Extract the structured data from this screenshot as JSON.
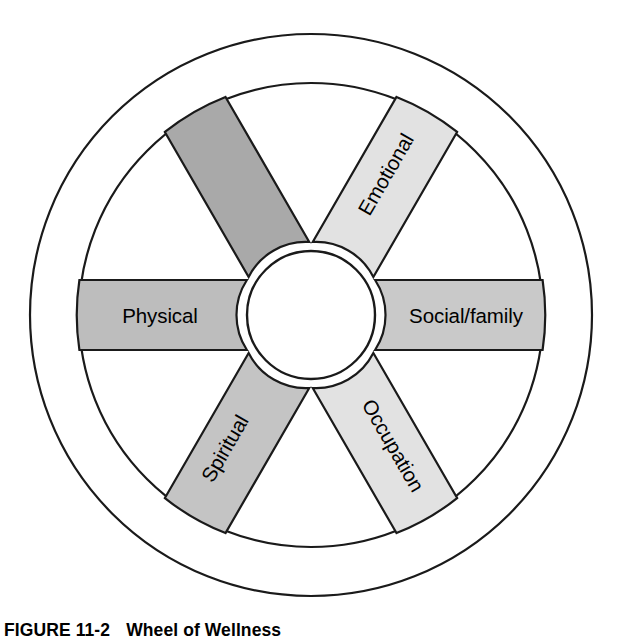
{
  "figure": {
    "caption_number": "FIGURE 11-2",
    "caption_title": "Wheel of Wellness",
    "title_alt": "Wheel of Wellness"
  },
  "wheel": {
    "center_x": 311,
    "center_y": 315,
    "outer_radius": 281,
    "inner_radius": 232,
    "hub_radius": 64,
    "spoke_half_width": 35,
    "stroke_color": "#1a1a1a",
    "background_color": "#ffffff",
    "hub_label": ""
  },
  "spokes": [
    {
      "id": "physical",
      "label": "Physical",
      "angle_deg": 180,
      "text_rotation_deg": 0,
      "fill": "#bdbdbd"
    },
    {
      "id": "mental",
      "label": "Mental",
      "angle_deg": 240,
      "text_rotation_deg": 60,
      "fill": "#e2e2e2"
    },
    {
      "id": "emotional",
      "label": "Emotional",
      "angle_deg": 300,
      "text_rotation_deg": -60,
      "fill": "#e2e2e2"
    },
    {
      "id": "social-family",
      "label": "Social/family",
      "angle_deg": 0,
      "text_rotation_deg": 0,
      "fill": "#c9c9c9"
    },
    {
      "id": "occupation",
      "label": "Occupation",
      "angle_deg": 60,
      "text_rotation_deg": 60,
      "fill": "#c4c4c4"
    },
    {
      "id": "spiritual",
      "label": "Spiritual",
      "angle_deg": 120,
      "text_rotation_deg": -60,
      "fill": "#a9a9a9"
    }
  ]
}
